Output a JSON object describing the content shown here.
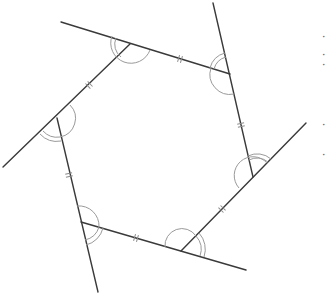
{
  "diagram": {
    "colors": {
      "line": "#3a3a3a",
      "arc": "#9a9a9a",
      "tick": "#8a8a8a",
      "background": "#ffffff"
    },
    "vertices": [
      {
        "id": "A",
        "x": 130,
        "y": 44
      },
      {
        "id": "B",
        "x": 230,
        "y": 74
      },
      {
        "id": "C",
        "x": 253,
        "y": 177
      },
      {
        "id": "D",
        "x": 181,
        "y": 251
      },
      {
        "id": "E",
        "x": 81,
        "y": 222
      },
      {
        "id": "F",
        "x": 57,
        "y": 118
      }
    ],
    "extended_lines": [
      {
        "from": [
          61,
          22
        ],
        "to": [
          230,
          74
        ],
        "note": "side AB extended past A"
      },
      {
        "from": [
          213,
          3
        ],
        "to": [
          253,
          177
        ],
        "note": "side BC extended past B"
      },
      {
        "from": [
          306,
          123
        ],
        "to": [
          181,
          251
        ],
        "note": "side CD extended past C"
      },
      {
        "from": [
          246,
          270
        ],
        "to": [
          81,
          222
        ],
        "note": "side DE extended past D"
      },
      {
        "from": [
          98,
          292
        ],
        "to": [
          57,
          118
        ],
        "note": "side EF extended past E"
      },
      {
        "from": [
          3,
          167
        ],
        "to": [
          130,
          44
        ],
        "note": "side FA extended past F"
      }
    ],
    "tick_marks": "double hash on each side midpoint (equal sides)",
    "angle_marks": "two arcs at each vertex (interior and exterior angle)",
    "clipped_edge_text": [
      "·",
      "·",
      "·",
      "·",
      "·"
    ]
  }
}
